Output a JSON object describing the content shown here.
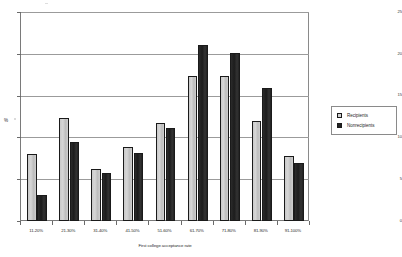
{
  "chart_data": {
    "type": "bar",
    "title": "",
    "xlabel": "First college acceptance rate",
    "ylabel": "%",
    "ylim": [
      0,
      25
    ],
    "yticks": [
      0,
      5,
      10,
      15,
      20,
      25
    ],
    "ytick_labels": [
      "0",
      "5",
      "10",
      "15",
      "20",
      "25"
    ],
    "grid": true,
    "legend_position": "right",
    "categories": [
      "11-20%",
      "21-30%",
      "31-40%",
      "41-50%",
      "51-60%",
      "61-70%",
      "71-80%",
      "81-90%",
      "91-100%"
    ],
    "series": [
      {
        "name": "Recipients",
        "color": "#d0d0d0",
        "values": [
          8.0,
          12.3,
          6.2,
          8.8,
          11.7,
          17.4,
          17.4,
          12.0,
          7.8
        ]
      },
      {
        "name": "Nonrecipients",
        "color": "#232323",
        "values": [
          3.1,
          9.4,
          5.8,
          8.1,
          11.1,
          21.0,
          20.1,
          15.9,
          6.9
        ]
      }
    ]
  },
  "axes": {
    "y_title": "%",
    "x_title": "First college acceptance rate"
  },
  "legend": {
    "entries": [
      {
        "label": "Recipients",
        "swatch": "light"
      },
      {
        "label": "Nonrecipients",
        "swatch": "dark"
      }
    ]
  }
}
